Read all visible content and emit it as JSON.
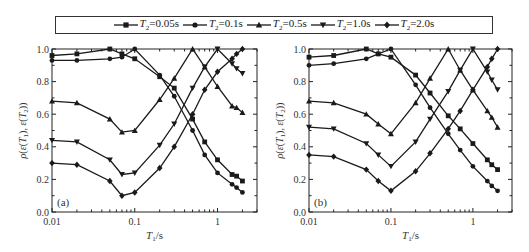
{
  "legend": {
    "items": [
      {
        "label": "T2=0.05s",
        "var": "T",
        "sub": "2",
        "rest": "=0.05s",
        "marker": "square"
      },
      {
        "label": "T2=0.1s",
        "var": "T",
        "sub": "2",
        "rest": "=0.1s",
        "marker": "circle"
      },
      {
        "label": "T2=0.5s",
        "var": "T",
        "sub": "2",
        "rest": "=0.5s",
        "marker": "triangle-up"
      },
      {
        "label": "T2=1.0s",
        "var": "T",
        "sub": "2",
        "rest": "=1.0s",
        "marker": "triangle-down"
      },
      {
        "label": "T2=2.0s",
        "var": "T",
        "sub": "2",
        "rest": "=2.0s",
        "marker": "diamond"
      }
    ]
  },
  "chart_data": [
    {
      "type": "line",
      "panel_label": "(a)",
      "note": "Estimated values: T1 positions assumed from marker placement; y values are approximate readings, and some near line crossings are inferred rather than confirmed.",
      "xscale": "log",
      "xlabel": "T1/s",
      "ylabel": "ρ(ε(T1), ε(T2))",
      "xlim": [
        0.01,
        3
      ],
      "ylim": [
        0.0,
        1.0
      ],
      "xticks": [
        "0.01",
        "0.1",
        "1"
      ],
      "yticks": [
        "0.0",
        "0.2",
        "0.4",
        "0.6",
        "0.8",
        "1.0"
      ],
      "grid": false,
      "x": [
        0.01,
        0.02,
        0.05,
        0.07,
        0.1,
        0.2,
        0.3,
        0.5,
        0.7,
        1.0,
        1.5,
        1.7,
        2.0
      ],
      "series": [
        {
          "name": "T2=0.05s",
          "marker": "square",
          "values": [
            0.96,
            0.97,
            1.0,
            0.97,
            0.94,
            0.83,
            0.76,
            0.57,
            0.43,
            0.32,
            0.23,
            0.22,
            0.19
          ]
        },
        {
          "name": "T2=0.1s",
          "marker": "circle",
          "values": [
            0.93,
            0.93,
            0.94,
            0.95,
            1.0,
            0.84,
            0.71,
            0.5,
            0.35,
            0.24,
            0.17,
            0.15,
            0.12
          ]
        },
        {
          "name": "T2=0.5s",
          "marker": "triangle-up",
          "values": [
            0.68,
            0.67,
            0.57,
            0.49,
            0.5,
            0.69,
            0.82,
            1.0,
            0.89,
            0.77,
            0.65,
            0.64,
            0.61
          ]
        },
        {
          "name": "T2=1.0s",
          "marker": "triangle-down",
          "values": [
            0.44,
            0.43,
            0.32,
            0.23,
            0.24,
            0.41,
            0.54,
            0.76,
            0.89,
            1.0,
            0.91,
            0.88,
            0.85
          ]
        },
        {
          "name": "T2=2.0s",
          "marker": "diamond",
          "values": [
            0.3,
            0.29,
            0.19,
            0.1,
            0.12,
            0.27,
            0.4,
            0.6,
            0.75,
            0.86,
            0.94,
            0.97,
            1.0
          ]
        }
      ]
    },
    {
      "type": "line",
      "panel_label": "(b)",
      "note": "Estimated values: T1 positions assumed from marker placement; y values are approximate readings, and some near line crossings are inferred rather than confirmed.",
      "xscale": "log",
      "xlabel": "T1/s",
      "ylabel": "ρ(ε(T1), ε(T2))",
      "xlim": [
        0.01,
        3
      ],
      "ylim": [
        0.0,
        1.0
      ],
      "xticks": [
        "0.01",
        "0.1",
        "1"
      ],
      "yticks": [
        "0.0",
        "0.2",
        "0.4",
        "0.6",
        "0.8",
        "1.0"
      ],
      "grid": false,
      "x": [
        0.01,
        0.02,
        0.05,
        0.07,
        0.1,
        0.2,
        0.3,
        0.5,
        0.7,
        1.0,
        1.5,
        1.7,
        2.0
      ],
      "series": [
        {
          "name": "T2=0.05s",
          "marker": "square",
          "values": [
            0.95,
            0.96,
            1.0,
            0.97,
            0.95,
            0.84,
            0.73,
            0.59,
            0.51,
            0.42,
            0.32,
            0.29,
            0.26
          ]
        },
        {
          "name": "T2=0.1s",
          "marker": "circle",
          "values": [
            0.9,
            0.91,
            0.94,
            0.97,
            1.0,
            0.78,
            0.64,
            0.48,
            0.38,
            0.28,
            0.19,
            0.16,
            0.13
          ]
        },
        {
          "name": "T2=0.5s",
          "marker": "triangle-up",
          "values": [
            0.68,
            0.67,
            0.6,
            0.54,
            0.48,
            0.67,
            0.82,
            1.0,
            0.87,
            0.75,
            0.62,
            0.58,
            0.52
          ]
        },
        {
          "name": "T2=1.0s",
          "marker": "triangle-down",
          "values": [
            0.52,
            0.51,
            0.42,
            0.35,
            0.28,
            0.43,
            0.57,
            0.74,
            0.87,
            1.0,
            0.86,
            0.81,
            0.75
          ]
        },
        {
          "name": "T2=2.0s",
          "marker": "diamond",
          "values": [
            0.35,
            0.34,
            0.26,
            0.19,
            0.13,
            0.25,
            0.36,
            0.51,
            0.62,
            0.75,
            0.89,
            0.94,
            1.0
          ]
        }
      ]
    }
  ],
  "layout": {
    "panels": [
      {
        "left": 52,
        "right": 257,
        "top": 49,
        "bottom": 212
      },
      {
        "left": 309,
        "right": 512,
        "top": 49,
        "bottom": 212
      }
    ]
  }
}
